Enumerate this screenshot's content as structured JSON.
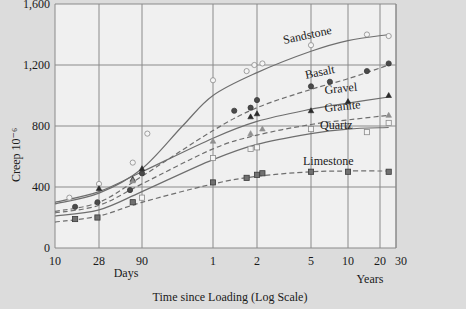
{
  "chart_data": {
    "type": "line",
    "title": "",
    "xlabel": "Time since Loading (Log Scale)",
    "ylabel": "Creep 10⁻⁶",
    "x_scale": "log",
    "x_unit": "days",
    "x_ticks": [
      {
        "label": "10",
        "days": 10
      },
      {
        "label": "28",
        "days": 28
      },
      {
        "label": "90",
        "days": 90
      },
      {
        "label": "1",
        "days": 365
      },
      {
        "label": "2",
        "days": 730
      },
      {
        "label": "5",
        "days": 1825
      },
      {
        "label": "10",
        "days": 3650
      },
      {
        "label": "20",
        "days": 7300
      },
      {
        "label": "30",
        "days": 10950
      }
    ],
    "x_sublabels": {
      "days": "Days",
      "years": "Years"
    },
    "y_ticks": [
      "0",
      "400",
      "800",
      "1,200",
      "1,600"
    ],
    "y_tick_values": [
      0,
      400,
      800,
      1200,
      1600
    ],
    "ylim": [
      0,
      1600
    ],
    "xlim_days": [
      10,
      11000
    ],
    "grid": true,
    "legend": "inline labels",
    "series": [
      {
        "name": "Sandstone",
        "marker": "open-circle",
        "line": "solid",
        "points": [
          [
            14,
            330
          ],
          [
            28,
            420
          ],
          [
            70,
            560
          ],
          [
            100,
            750
          ],
          [
            365,
            1100
          ],
          [
            620,
            1160
          ],
          [
            700,
            1200
          ],
          [
            800,
            1210
          ],
          [
            1825,
            1330
          ],
          [
            5500,
            1400
          ],
          [
            9100,
            1390
          ]
        ],
        "curve": [
          [
            10,
            290
          ],
          [
            28,
            360
          ],
          [
            90,
            520
          ],
          [
            200,
            800
          ],
          [
            365,
            1000
          ],
          [
            730,
            1150
          ],
          [
            1825,
            1290
          ],
          [
            3650,
            1360
          ],
          [
            9100,
            1400
          ]
        ]
      },
      {
        "name": "Basalt",
        "marker": "filled-circle",
        "line": "dashed",
        "points": [
          [
            16,
            270
          ],
          [
            27,
            300
          ],
          [
            65,
            380
          ],
          [
            90,
            490
          ],
          [
            510,
            900
          ],
          [
            660,
            920
          ],
          [
            730,
            970
          ],
          [
            1825,
            1060
          ],
          [
            2600,
            1090
          ],
          [
            5500,
            1160
          ],
          [
            9100,
            1210
          ]
        ],
        "curve": [
          [
            10,
            240
          ],
          [
            28,
            300
          ],
          [
            90,
            470
          ],
          [
            365,
            770
          ],
          [
            730,
            920
          ],
          [
            1825,
            1040
          ],
          [
            3650,
            1110
          ],
          [
            9100,
            1200
          ]
        ]
      },
      {
        "name": "Gravel",
        "marker": "filled-triangle",
        "line": "solid",
        "points": [
          [
            28,
            390
          ],
          [
            70,
            450
          ],
          [
            90,
            520
          ],
          [
            660,
            860
          ],
          [
            730,
            880
          ],
          [
            1825,
            900
          ],
          [
            3650,
            960
          ],
          [
            9100,
            1000
          ]
        ],
        "curve": [
          [
            10,
            300
          ],
          [
            28,
            370
          ],
          [
            90,
            500
          ],
          [
            365,
            720
          ],
          [
            730,
            830
          ],
          [
            1825,
            910
          ],
          [
            3650,
            950
          ],
          [
            9100,
            990
          ]
        ]
      },
      {
        "name": "Granite",
        "marker": "open-triangle",
        "line": "dashed",
        "points": [
          [
            70,
            440
          ],
          [
            365,
            700
          ],
          [
            660,
            750
          ],
          [
            800,
            780
          ],
          [
            3650,
            800
          ],
          [
            9100,
            870
          ]
        ],
        "curve": [
          [
            10,
            230
          ],
          [
            28,
            280
          ],
          [
            90,
            420
          ],
          [
            365,
            650
          ],
          [
            730,
            740
          ],
          [
            1825,
            810
          ],
          [
            3650,
            840
          ],
          [
            9100,
            870
          ]
        ]
      },
      {
        "name": "Quartz",
        "marker": "open-square",
        "line": "solid",
        "points": [
          [
            90,
            330
          ],
          [
            365,
            590
          ],
          [
            660,
            650
          ],
          [
            730,
            660
          ],
          [
            1825,
            780
          ],
          [
            5500,
            760
          ],
          [
            9100,
            820
          ]
        ],
        "curve": [
          [
            10,
            210
          ],
          [
            28,
            250
          ],
          [
            90,
            370
          ],
          [
            365,
            580
          ],
          [
            730,
            680
          ],
          [
            1825,
            750
          ],
          [
            3650,
            780
          ],
          [
            9100,
            790
          ]
        ]
      },
      {
        "name": "Limestone",
        "marker": "filled-square",
        "line": "dashed",
        "points": [
          [
            16,
            190
          ],
          [
            27,
            200
          ],
          [
            70,
            300
          ],
          [
            365,
            430
          ],
          [
            620,
            460
          ],
          [
            730,
            480
          ],
          [
            800,
            490
          ],
          [
            1825,
            500
          ],
          [
            3650,
            500
          ],
          [
            9100,
            500
          ]
        ],
        "curve": [
          [
            10,
            170
          ],
          [
            28,
            210
          ],
          [
            90,
            300
          ],
          [
            365,
            420
          ],
          [
            730,
            470
          ],
          [
            1825,
            500
          ],
          [
            3650,
            505
          ],
          [
            9100,
            505
          ]
        ]
      }
    ],
    "label_positions": {
      "Sandstone": [
        284,
        44,
        -12
      ],
      "Basalt": [
        306,
        79,
        -12
      ],
      "Gravel": [
        325,
        94,
        -6
      ],
      "Granite": [
        325,
        112,
        -6
      ],
      "Quartz": [
        320,
        129,
        0
      ],
      "Limestone": [
        303,
        165,
        0
      ]
    }
  }
}
